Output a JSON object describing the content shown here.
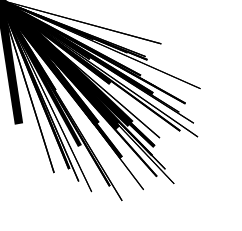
{
  "figure": {
    "title": "Recursive Fractal Arrow",
    "type": "vector-illustration",
    "width": 242,
    "height": 231,
    "background_color": "#ffffff",
    "ink_color": "#000000"
  },
  "geometry": {
    "root": {
      "name": "main-shaft-arrow",
      "start": {
        "x": 19,
        "y": 124
      },
      "end": {
        "x": 222,
        "y": 124
      },
      "shaft_width": 8.5,
      "head_length": 52,
      "head_half_width": 25,
      "head_barb_inset": 0.42,
      "angle_deg": 0
    },
    "branch_origin_t": 0.385,
    "recursion": {
      "max_depth": 4,
      "child_count": 2,
      "branch_angles_deg": [
        -58,
        58
      ],
      "length_ratio": 0.62,
      "width_ratio": 0.56,
      "head_ratio": 0.6,
      "sub_branch_origin_t": 0.46,
      "sub_branch_angles_deg": [
        -62,
        50
      ],
      "tertiary_angles_deg": [
        -70,
        44
      ]
    },
    "branches": [
      {
        "name": "upper-primary-branch",
        "start": {
          "x": 97,
          "y": 124
        },
        "end": {
          "x": 131,
          "y": 18
        },
        "length": 111,
        "angle_deg": -72,
        "shaft_width": 6.5,
        "head_length": 34,
        "head_half_width": 15,
        "depth": 1
      },
      {
        "name": "lower-primary-branch",
        "start": {
          "x": 97,
          "y": 124
        },
        "end": {
          "x": 160,
          "y": 212
        },
        "length": 108,
        "angle_deg": 54,
        "shaft_width": 6.5,
        "head_length": 34,
        "head_half_width": 15,
        "depth": 1
      },
      {
        "name": "upper-right-diagonal-branch",
        "start": {
          "x": 118,
          "y": 124
        },
        "end": {
          "x": 209,
          "y": 45
        },
        "length": 120,
        "angle_deg": -41,
        "shaft_width": 6.5,
        "head_length": 36,
        "head_half_width": 16,
        "depth": 1
      },
      {
        "name": "lower-right-diagonal-branch",
        "start": {
          "x": 118,
          "y": 128
        },
        "end": {
          "x": 212,
          "y": 176
        },
        "length": 106,
        "angle_deg": 27,
        "shaft_width": 6,
        "head_length": 32,
        "head_half_width": 14,
        "depth": 1
      },
      {
        "name": "upper-left-secondary-branch",
        "start": {
          "x": 81,
          "y": 88
        },
        "end": {
          "x": 44,
          "y": 76
        },
        "length": 39,
        "angle_deg": 198,
        "shaft_width": 4.5,
        "head_length": 22,
        "head_half_width": 10,
        "depth": 2
      },
      {
        "name": "lower-left-secondary-branch",
        "start": {
          "x": 80,
          "y": 146
        },
        "end": {
          "x": 56,
          "y": 196
        },
        "length": 55,
        "angle_deg": 115,
        "shaft_width": 4.5,
        "head_length": 22,
        "head_half_width": 10,
        "depth": 2
      }
    ]
  }
}
